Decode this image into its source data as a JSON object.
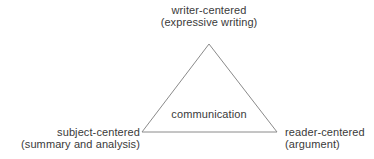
{
  "diagram": {
    "shape": "triangle",
    "line_color": "#8a8a8a",
    "text_color": "#3a3a3a",
    "center_label": "communication",
    "vertices": {
      "top": {
        "line1": "writer-centered",
        "line2": "(expressive writing)"
      },
      "bottom_left": {
        "line1": "subject-centered",
        "line2": "(summary and analysis)"
      },
      "bottom_right": {
        "line1": "reader-centered",
        "line2": "(argument)"
      }
    }
  }
}
